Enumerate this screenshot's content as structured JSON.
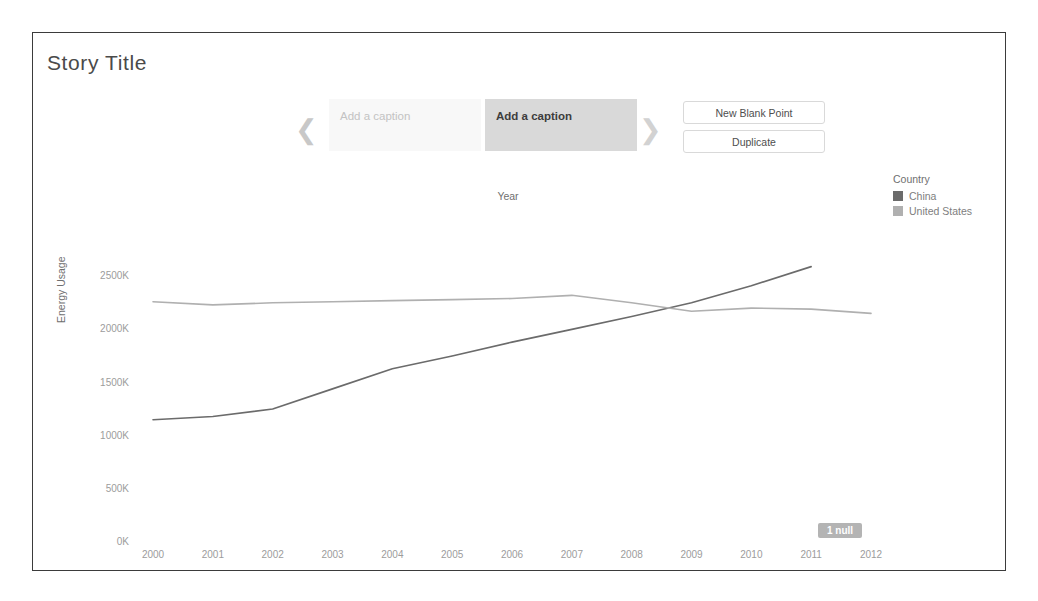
{
  "story": {
    "title": "Story Title",
    "nav": {
      "prev_icon": "chevron-left-icon",
      "next_icon": "chevron-right-icon",
      "tabs": [
        {
          "label": "Add a caption",
          "state": "inactive"
        },
        {
          "label": "Add a caption",
          "state": "active"
        }
      ],
      "buttons": [
        {
          "label": "New Blank Point"
        },
        {
          "label": "Duplicate"
        }
      ]
    }
  },
  "legend": {
    "title": "Country",
    "items": [
      {
        "label": "China",
        "color": "#6b6b6b"
      },
      {
        "label": "United States",
        "color": "#b0b0b0"
      }
    ]
  },
  "null_badge": {
    "label": "1 null"
  },
  "chart_data": {
    "type": "line",
    "title": "",
    "xlabel": "Year",
    "ylabel": "Energy Usage",
    "x": [
      2000,
      2001,
      2002,
      2003,
      2004,
      2005,
      2006,
      2007,
      2008,
      2009,
      2010,
      2011,
      2012
    ],
    "xtick_labels": [
      "2000",
      "2001",
      "2002",
      "2003",
      "2004",
      "2005",
      "2006",
      "2007",
      "2008",
      "2009",
      "2010",
      "2011",
      "2012"
    ],
    "ytick_labels": [
      "0K",
      "500K",
      "1000K",
      "1500K",
      "2000K",
      "2500K"
    ],
    "ytick_values": [
      0,
      500000,
      1000000,
      1500000,
      2000000,
      2500000
    ],
    "ylim": [
      0,
      2700000
    ],
    "xlim": [
      2000,
      2012
    ],
    "grid": false,
    "legend_position": "right",
    "series": [
      {
        "name": "China",
        "color": "#6b6b6b",
        "values": [
          1160000,
          1190000,
          1260000,
          1450000,
          1640000,
          1760000,
          1890000,
          2010000,
          2130000,
          2260000,
          2420000,
          2600000,
          null
        ]
      },
      {
        "name": "United States",
        "color": "#b0b0b0",
        "values": [
          2270000,
          2240000,
          2260000,
          2270000,
          2280000,
          2290000,
          2300000,
          2330000,
          2260000,
          2180000,
          2210000,
          2200000,
          2160000
        ]
      }
    ]
  }
}
